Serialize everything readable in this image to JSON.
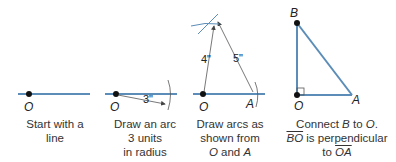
{
  "colors": {
    "line": "#5b8db8",
    "thin": "#666666",
    "text": "#333333"
  },
  "steps": [
    {
      "caption": [
        "Start with a",
        "line"
      ],
      "points": [
        "O"
      ]
    },
    {
      "caption": [
        "Draw an arc",
        "3 units",
        "in radius"
      ],
      "points": [
        "O"
      ],
      "measure": "3\""
    },
    {
      "caption": [
        "Draw arcs as",
        "shown from",
        "O and A"
      ],
      "points": [
        "O",
        "A"
      ],
      "measures": [
        "4\"",
        "5\""
      ]
    },
    {
      "caption": [
        "Connect B to O.",
        "BO is perpendicular",
        "to OA"
      ],
      "points": [
        "B",
        "O",
        "A"
      ]
    }
  ],
  "labels": {
    "O": "O",
    "A": "A",
    "B": "B",
    "m3": "3\"",
    "m4": "4\"",
    "m5": "5\"",
    "cap1a": "Start with a",
    "cap1b": "line",
    "cap2a": "Draw an arc",
    "cap2b": "3 units",
    "cap2c": "in radius",
    "cap3a": "Draw arcs as",
    "cap3b": "shown from",
    "cap3c_o": "O",
    "cap3c_and": " and ",
    "cap3c_a": "A",
    "cap4a_1": "Connect ",
    "cap4a_b": "B",
    "cap4a_2": " to ",
    "cap4a_o": "O",
    "cap4a_3": ".",
    "cap4b_bo": "BO",
    "cap4b_rest": " is perpendicular",
    "cap4c_to": "to ",
    "cap4c_oa": "OA"
  }
}
